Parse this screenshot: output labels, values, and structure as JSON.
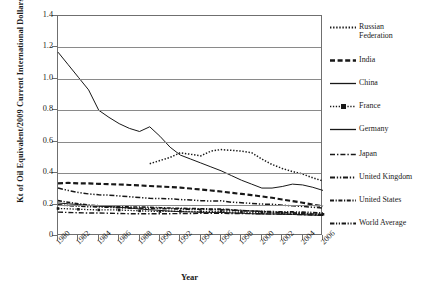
{
  "chart_data": {
    "type": "line",
    "title": "",
    "xlabel": "Year",
    "ylabel": "Kt of Oil Equivalent/2009 Current International Dollars",
    "xlim": [
      1980,
      2006
    ],
    "ylim": [
      0,
      1.4
    ],
    "ytick_labels": [
      "1.4",
      "1.2",
      "1.0",
      "0.8",
      "0.6",
      "0.4",
      "0.2",
      "0"
    ],
    "ytick_values": [
      1.4,
      1.2,
      1.0,
      0.8,
      0.6,
      0.4,
      0.2,
      0
    ],
    "xtick_labels": [
      "1980",
      "1982",
      "1984",
      "1986",
      "1988",
      "1990",
      "1992",
      "1994",
      "1996",
      "1998",
      "2000",
      "2002",
      "2004",
      "2006"
    ],
    "xtick_values": [
      1980,
      1982,
      1984,
      1986,
      1988,
      1990,
      1992,
      1994,
      1996,
      1998,
      2000,
      2002,
      2004,
      2006
    ],
    "x": [
      1980,
      1981,
      1982,
      1983,
      1984,
      1985,
      1986,
      1987,
      1988,
      1989,
      1990,
      1991,
      1992,
      1993,
      1994,
      1995,
      1996,
      1997,
      1998,
      1999,
      2000,
      2001,
      2002,
      2003,
      2004,
      2005,
      2006
    ],
    "grid": "horizontal",
    "legend_position": "right",
    "series": [
      {
        "name": "Russian Federation",
        "style": "dotted",
        "x": [
          1989,
          1990,
          1991,
          1992,
          1993,
          1994,
          1995,
          1996,
          1997,
          1998,
          1999,
          2000,
          2001,
          2002,
          2003,
          2004,
          2005,
          2006
        ],
        "values": [
          0.46,
          0.48,
          0.5,
          0.53,
          0.52,
          0.51,
          0.54,
          0.55,
          0.545,
          0.54,
          0.53,
          0.49,
          0.455,
          0.43,
          0.41,
          0.395,
          0.37,
          0.35
        ]
      },
      {
        "name": "India",
        "style": "thick-dashed",
        "values": [
          0.335,
          0.338,
          0.335,
          0.335,
          0.332,
          0.33,
          0.328,
          0.325,
          0.322,
          0.318,
          0.315,
          0.312,
          0.308,
          0.302,
          0.296,
          0.29,
          0.283,
          0.275,
          0.268,
          0.26,
          0.252,
          0.243,
          0.232,
          0.222,
          0.212,
          0.2,
          0.19
        ]
      },
      {
        "name": "China",
        "style": "solid",
        "values": [
          1.17,
          1.09,
          1.01,
          0.93,
          0.8,
          0.755,
          0.715,
          0.685,
          0.665,
          0.695,
          0.635,
          0.565,
          0.515,
          0.49,
          0.465,
          0.44,
          0.415,
          0.385,
          0.355,
          0.33,
          0.305,
          0.305,
          0.315,
          0.33,
          0.325,
          0.31,
          0.29
        ]
      },
      {
        "name": "France",
        "style": "dotted-square-marker",
        "values": [
          0.175,
          0.173,
          0.17,
          0.168,
          0.166,
          0.167,
          0.165,
          0.163,
          0.16,
          0.158,
          0.156,
          0.158,
          0.157,
          0.157,
          0.155,
          0.155,
          0.156,
          0.152,
          0.152,
          0.15,
          0.147,
          0.147,
          0.145,
          0.145,
          0.143,
          0.141,
          0.138
        ]
      },
      {
        "name": "Germany",
        "style": "thin-solid",
        "values": [
          0.21,
          0.205,
          0.2,
          0.195,
          0.19,
          0.187,
          0.183,
          0.178,
          0.172,
          0.167,
          0.163,
          0.158,
          0.155,
          0.153,
          0.151,
          0.15,
          0.15,
          0.147,
          0.145,
          0.142,
          0.14,
          0.14,
          0.138,
          0.137,
          0.135,
          0.133,
          0.13
        ]
      },
      {
        "name": "Japan",
        "style": "dash-dot",
        "values": [
          0.152,
          0.15,
          0.148,
          0.146,
          0.146,
          0.145,
          0.143,
          0.142,
          0.142,
          0.142,
          0.142,
          0.142,
          0.143,
          0.143,
          0.144,
          0.145,
          0.145,
          0.143,
          0.143,
          0.142,
          0.141,
          0.14,
          0.139,
          0.138,
          0.136,
          0.134,
          0.132
        ]
      },
      {
        "name": "United Kingdom",
        "style": "dash-dot-dot",
        "values": [
          0.305,
          0.29,
          0.277,
          0.268,
          0.262,
          0.26,
          0.255,
          0.25,
          0.245,
          0.24,
          0.238,
          0.237,
          0.232,
          0.229,
          0.225,
          0.222,
          0.224,
          0.215,
          0.212,
          0.207,
          0.203,
          0.202,
          0.196,
          0.192,
          0.188,
          0.183,
          0.178
        ]
      },
      {
        "name": "United States",
        "style": "dash-dot-short",
        "values": [
          0.225,
          0.215,
          0.205,
          0.197,
          0.193,
          0.19,
          0.186,
          0.185,
          0.185,
          0.183,
          0.18,
          0.178,
          0.176,
          0.175,
          0.173,
          0.172,
          0.171,
          0.167,
          0.163,
          0.159,
          0.156,
          0.151,
          0.149,
          0.147,
          0.144,
          0.14,
          0.136
        ]
      },
      {
        "name": "World Average",
        "style": "dash-dot-dot-b",
        "values": [
          0.198,
          0.194,
          0.19,
          0.187,
          0.185,
          0.183,
          0.18,
          0.178,
          0.177,
          0.176,
          0.175,
          0.174,
          0.172,
          0.171,
          0.17,
          0.168,
          0.167,
          0.164,
          0.161,
          0.159,
          0.157,
          0.155,
          0.153,
          0.153,
          0.152,
          0.149,
          0.146
        ]
      }
    ]
  },
  "legend": {
    "items": [
      {
        "label": "Russian Federation",
        "key": "russian-federation"
      },
      {
        "label": "India",
        "key": "india"
      },
      {
        "label": "China",
        "key": "china"
      },
      {
        "label": "France",
        "key": "france"
      },
      {
        "label": "Germany",
        "key": "germany"
      },
      {
        "label": "Japan",
        "key": "japan"
      },
      {
        "label": "United Kingdom",
        "key": "united-kingdom"
      },
      {
        "label": "United States",
        "key": "united-states"
      },
      {
        "label": "World Average",
        "key": "world-average"
      }
    ]
  }
}
